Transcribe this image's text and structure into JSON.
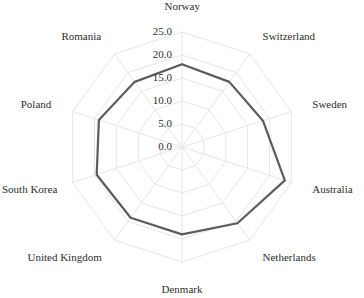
{
  "chart_data": {
    "type": "radar",
    "title": "",
    "subtitle": "",
    "xlabel": "",
    "ylabel": "",
    "grid": true,
    "legend": false,
    "legend_position": "none",
    "rlim": [
      0.0,
      25.0
    ],
    "tick_labels": [
      "25.0",
      "20.0",
      "15.0",
      "10.0",
      "5.0",
      "0.0"
    ],
    "tick_values": [
      25.0,
      20.0,
      15.0,
      10.0,
      5.0,
      0.0
    ],
    "categories": [
      "Norway",
      "Switzerland",
      "Sweden",
      "Australia",
      "Netherlands",
      "Denmark",
      "United Kingdom",
      "South Korea",
      "Poland",
      "Romania"
    ],
    "series": [
      {
        "name": "Series 1",
        "color": "#5c5c5c",
        "values": [
          18.0,
          17.5,
          18.5,
          23.5,
          20.5,
          19.0,
          19.0,
          19.5,
          19.0,
          17.5
        ]
      }
    ]
  },
  "axis": {
    "grid_color": "#e6e6e6",
    "label_color": "#2e2e2e"
  }
}
